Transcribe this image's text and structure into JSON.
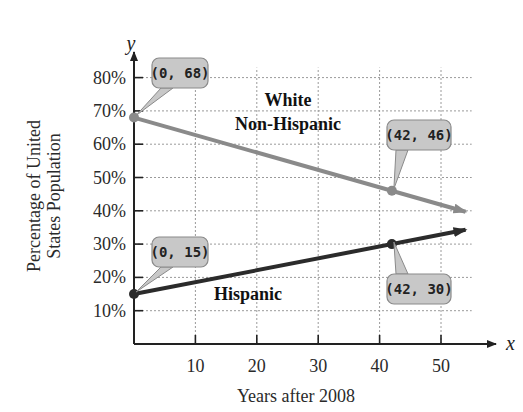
{
  "chart_data": {
    "type": "line",
    "title": "",
    "xlabel": "Years after 2008",
    "ylabel_lines": [
      "Percentage of United",
      "States Population"
    ],
    "x_axis_var": "x",
    "y_axis_var": "y",
    "xlim": [
      0,
      55
    ],
    "ylim": [
      0,
      85
    ],
    "x_ticks": [
      10,
      20,
      30,
      40,
      50
    ],
    "x_tick_labels": [
      "10",
      "20",
      "30",
      "40",
      "50"
    ],
    "y_ticks": [
      10,
      20,
      30,
      40,
      50,
      60,
      70,
      80
    ],
    "y_tick_labels": [
      "10%",
      "20%",
      "30%",
      "40%",
      "50%",
      "60%",
      "70%",
      "80%"
    ],
    "grid": true,
    "series": [
      {
        "name": "White Non-Hispanic",
        "label_lines": [
          "White",
          "Non-Hispanic"
        ],
        "color": "#8a8a8a",
        "points": [
          {
            "x": 0,
            "y": 68
          },
          {
            "x": 42,
            "y": 46
          }
        ],
        "extends_to_x": 54
      },
      {
        "name": "Hispanic",
        "label_lines": [
          "Hispanic"
        ],
        "color": "#2b2b2b",
        "points": [
          {
            "x": 0,
            "y": 15
          },
          {
            "x": 42,
            "y": 30
          }
        ],
        "extends_to_x": 54
      }
    ],
    "annotations": [
      {
        "text": "(0, 68)",
        "x": 0,
        "y": 68
      },
      {
        "text": "(42, 46)",
        "x": 42,
        "y": 46
      },
      {
        "text": "(0, 15)",
        "x": 0,
        "y": 15
      },
      {
        "text": "(42, 30)",
        "x": 42,
        "y": 30
      }
    ]
  }
}
